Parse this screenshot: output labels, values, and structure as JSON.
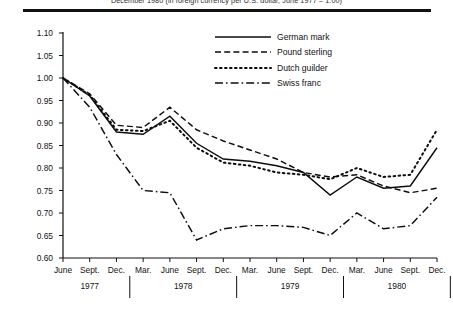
{
  "header": {
    "title": "December 1980 (in foreign currency per U.S. dollar, June 1977 = 1.00)"
  },
  "legend": {
    "items": [
      {
        "label": "German mark",
        "style": "solid"
      },
      {
        "label": "Pound sterling",
        "style": "dashed"
      },
      {
        "label": "Dutch guilder",
        "style": "dotted"
      },
      {
        "label": "Swiss franc",
        "style": "dash-dot"
      }
    ]
  },
  "chart_data": {
    "type": "line",
    "title": "December 1980 (in foreign currency per U.S. dollar, June 1977 = 1.00)",
    "xlabel": "",
    "ylabel": "",
    "ylim": [
      0.6,
      1.1
    ],
    "ytick_step": 0.05,
    "yticks": [
      "1.10",
      "1.05",
      "1.00",
      "0.95",
      "0.90",
      "0.85",
      "0.80",
      "0.75",
      "0.70",
      "0.65",
      "0.60"
    ],
    "ytick_values": [
      1.1,
      1.05,
      1.0,
      0.95,
      0.9,
      0.85,
      0.8,
      0.75,
      0.7,
      0.65,
      0.6
    ],
    "grid": false,
    "legend_position": "top-right",
    "x": [
      "June",
      "Sept.",
      "Dec.",
      "Mar.",
      "June",
      "Sept.",
      "Dec.",
      "Mar.",
      "June",
      "Sept.",
      "Dec.",
      "Mar.",
      "June",
      "Sept.",
      "Dec."
    ],
    "year_groups": [
      {
        "label": "1977",
        "start_index": 0,
        "end_index": 2
      },
      {
        "label": "1978",
        "start_index": 3,
        "end_index": 6
      },
      {
        "label": "1979",
        "start_index": 7,
        "end_index": 10
      },
      {
        "label": "1980",
        "start_index": 11,
        "end_index": 14
      }
    ],
    "series": [
      {
        "name": "German mark",
        "style": "solid",
        "values": [
          1.0,
          0.96,
          0.88,
          0.875,
          0.915,
          0.855,
          0.82,
          0.815,
          0.805,
          0.79,
          0.74,
          0.78,
          0.755,
          0.76,
          0.845
        ]
      },
      {
        "name": "Pound sterling",
        "style": "dashed",
        "values": [
          1.0,
          0.965,
          0.895,
          0.89,
          0.935,
          0.885,
          0.86,
          0.84,
          0.82,
          0.79,
          0.78,
          0.785,
          0.76,
          0.745,
          0.755
        ]
      },
      {
        "name": "Dutch guilder",
        "style": "dotted",
        "values": [
          1.0,
          0.962,
          0.885,
          0.882,
          0.905,
          0.845,
          0.812,
          0.805,
          0.79,
          0.785,
          0.775,
          0.8,
          0.78,
          0.785,
          0.885
        ]
      },
      {
        "name": "Swiss franc",
        "style": "dash-dot",
        "values": [
          1.0,
          0.935,
          0.83,
          0.75,
          0.745,
          0.64,
          0.665,
          0.672,
          0.672,
          0.668,
          0.65,
          0.7,
          0.665,
          0.672,
          0.735
        ]
      }
    ]
  }
}
